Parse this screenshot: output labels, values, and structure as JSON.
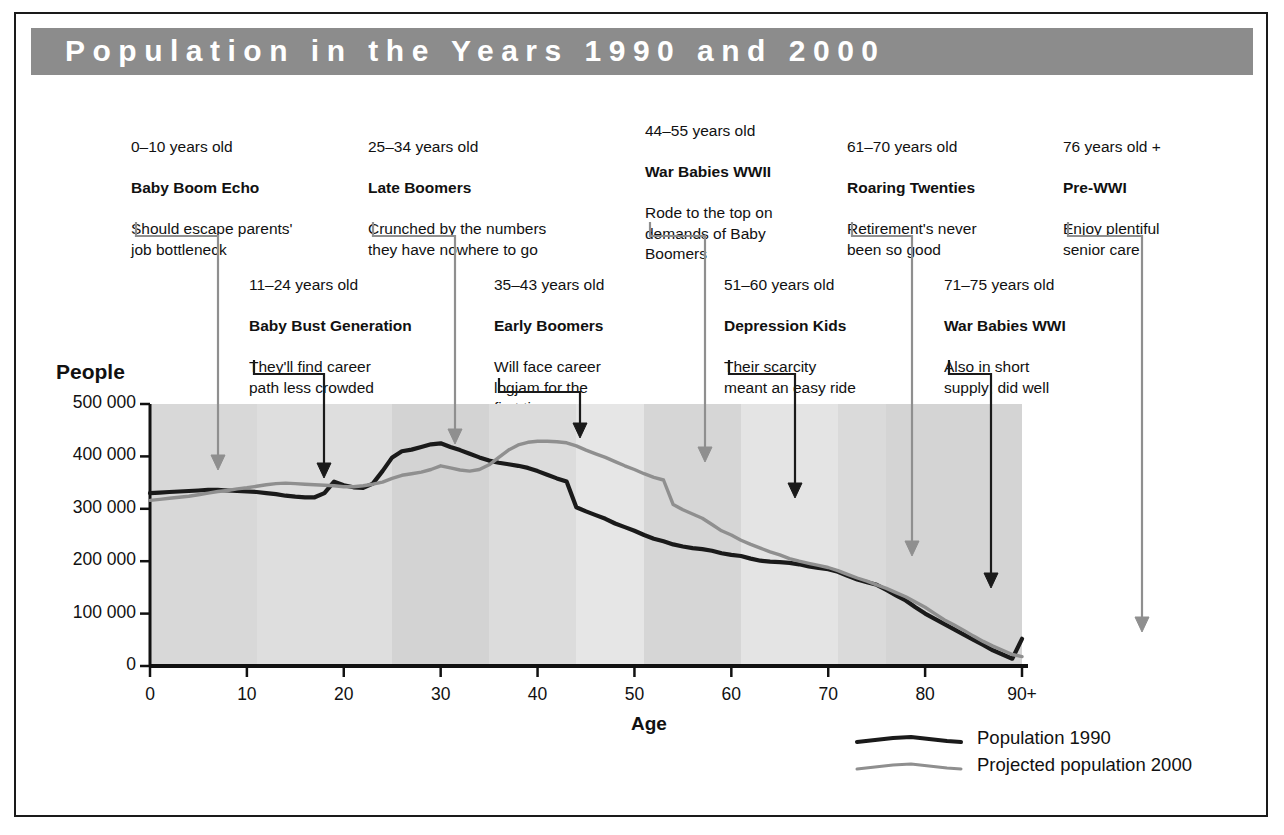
{
  "title": "Population in the Years 1990 and 2000",
  "axes": {
    "y_title": "People",
    "x_title": "Age",
    "y_ticks": [
      "500 000",
      "400 000",
      "300 000",
      "200 000",
      "100 000",
      "0"
    ],
    "x_ticks": [
      "0",
      "10",
      "20",
      "30",
      "40",
      "50",
      "60",
      "70",
      "80",
      "90+"
    ]
  },
  "legend": [
    {
      "label": "Population 1990",
      "color": "#1a1a1a"
    },
    {
      "label": "Projected population 2000",
      "color": "#8f8f8f"
    }
  ],
  "notes": [
    {
      "age": "0–10 years old",
      "name": "Baby Boom Echo",
      "desc": "Should escape parents'\njob bottleneck",
      "arrow_color": "#8f8f8f"
    },
    {
      "age": "11–24 years old",
      "name": "Baby Bust Generation",
      "desc": "They'll find career\npath less crowded",
      "arrow_color": "#1a1a1a"
    },
    {
      "age": "25–34 years old",
      "name": "Late Boomers",
      "desc": "Crunched by the numbers\nthey have nowhere to go",
      "arrow_color": "#8f8f8f"
    },
    {
      "age": "35–43 years old",
      "name": "Early Boomers",
      "desc": "Will face career\nlogjam for the\nfirst time",
      "arrow_color": "#1a1a1a"
    },
    {
      "age": "44–55 years old",
      "name": "War Babies WWII",
      "desc": "Rode to the top on\ndemands of Baby\nBoomers",
      "arrow_color": "#8f8f8f"
    },
    {
      "age": "51–60 years old",
      "name": "Depression Kids",
      "desc": "Their scarcity\nmeant an easy ride",
      "arrow_color": "#1a1a1a"
    },
    {
      "age": "61–70 years old",
      "name": "Roaring Twenties",
      "desc": "Retirement's never\nbeen so good",
      "arrow_color": "#8f8f8f"
    },
    {
      "age": "71–75 years old",
      "name": "War Babies WWI",
      "desc": "Also in short\nsupply; did well",
      "arrow_color": "#1a1a1a"
    },
    {
      "age": "76 years old +",
      "name": "Pre-WWI",
      "desc": "Enjoy plentiful\nsenior care",
      "arrow_color": "#8f8f8f"
    }
  ],
  "chart_data": {
    "type": "line",
    "title": "Population in the Years 1990 and 2000",
    "xlabel": "Age",
    "ylabel": "People",
    "xlim": [
      0,
      90
    ],
    "ylim": [
      0,
      500000
    ],
    "grid": false,
    "legend_position": "bottom-right",
    "x": [
      0,
      1,
      2,
      3,
      4,
      5,
      6,
      7,
      8,
      9,
      10,
      11,
      12,
      13,
      14,
      15,
      16,
      17,
      18,
      19,
      20,
      21,
      22,
      23,
      24,
      25,
      26,
      27,
      28,
      29,
      30,
      31,
      32,
      33,
      34,
      35,
      36,
      37,
      38,
      39,
      40,
      41,
      42,
      43,
      44,
      45,
      46,
      47,
      48,
      49,
      50,
      51,
      52,
      53,
      54,
      55,
      56,
      57,
      58,
      59,
      60,
      61,
      62,
      63,
      64,
      65,
      66,
      67,
      68,
      69,
      70,
      71,
      72,
      73,
      74,
      75,
      76,
      77,
      78,
      79,
      80,
      81,
      82,
      83,
      84,
      85,
      86,
      87,
      88,
      89,
      90
    ],
    "series": [
      {
        "name": "Population 1990",
        "color": "#1a1a1a",
        "values": [
          330000,
          331000,
          332000,
          333000,
          334000,
          335000,
          336000,
          336000,
          335000,
          334000,
          333000,
          332000,
          330000,
          328000,
          325000,
          323000,
          322000,
          322000,
          330000,
          352000,
          345000,
          341000,
          340000,
          348000,
          372000,
          398000,
          410000,
          413000,
          418000,
          423000,
          425000,
          418000,
          412000,
          405000,
          398000,
          392000,
          388000,
          385000,
          382000,
          378000,
          372000,
          365000,
          358000,
          352000,
          303000,
          295000,
          288000,
          281000,
          272000,
          265000,
          258000,
          250000,
          243000,
          238000,
          232000,
          228000,
          225000,
          223000,
          220000,
          215000,
          212000,
          210000,
          205000,
          201000,
          199000,
          198000,
          197000,
          194000,
          190000,
          187000,
          185000,
          180000,
          172000,
          165000,
          160000,
          155000,
          145000,
          135000,
          125000,
          112000,
          100000,
          90000,
          80000,
          70000,
          60000,
          50000,
          40000,
          30000,
          22000,
          14000,
          52000
        ]
      },
      {
        "name": "Projected population 2000",
        "color": "#8f8f8f",
        "values": [
          316000,
          318000,
          320000,
          322000,
          324000,
          327000,
          330000,
          333000,
          335000,
          338000,
          340000,
          343000,
          346000,
          348000,
          349000,
          348000,
          347000,
          346000,
          345000,
          344000,
          342000,
          342000,
          344000,
          347000,
          351000,
          358000,
          364000,
          367000,
          370000,
          375000,
          382000,
          378000,
          374000,
          372000,
          375000,
          384000,
          398000,
          412000,
          422000,
          427000,
          429000,
          429000,
          428000,
          426000,
          420000,
          412000,
          405000,
          398000,
          390000,
          382000,
          375000,
          367000,
          360000,
          355000,
          308000,
          298000,
          290000,
          282000,
          270000,
          258000,
          250000,
          240000,
          232000,
          225000,
          218000,
          212000,
          205000,
          200000,
          196000,
          192000,
          188000,
          182000,
          175000,
          168000,
          162000,
          155000,
          148000,
          140000,
          132000,
          122000,
          112000,
          100000,
          88000,
          78000,
          68000,
          57000,
          47000,
          38000,
          30000,
          22000,
          18000
        ]
      }
    ],
    "bands": [
      {
        "from": 0,
        "to": 11,
        "color": "#d8d8d8"
      },
      {
        "from": 11,
        "to": 25,
        "color": "#dedede"
      },
      {
        "from": 25,
        "to": 35,
        "color": "#d3d3d3"
      },
      {
        "from": 35,
        "to": 44,
        "color": "#dcdcdc"
      },
      {
        "from": 44,
        "to": 51,
        "color": "#e6e6e6"
      },
      {
        "from": 51,
        "to": 61,
        "color": "#d6d6d6"
      },
      {
        "from": 61,
        "to": 71,
        "color": "#e4e4e4"
      },
      {
        "from": 71,
        "to": 76,
        "color": "#dadada"
      },
      {
        "from": 76,
        "to": 90,
        "color": "#d4d4d4"
      }
    ]
  }
}
